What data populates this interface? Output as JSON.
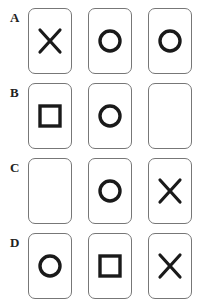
{
  "rows": [
    {
      "label": "A",
      "cards": [
        "cross",
        "circle",
        "circle"
      ]
    },
    {
      "label": "B",
      "cards": [
        "square",
        "circle",
        "empty"
      ]
    },
    {
      "label": "C",
      "cards": [
        "empty",
        "circle",
        "cross"
      ]
    },
    {
      "label": "D",
      "cards": [
        "circle",
        "square",
        "cross"
      ]
    }
  ],
  "colors": {
    "symbol": "#1a1a1a",
    "border": "#777777"
  }
}
